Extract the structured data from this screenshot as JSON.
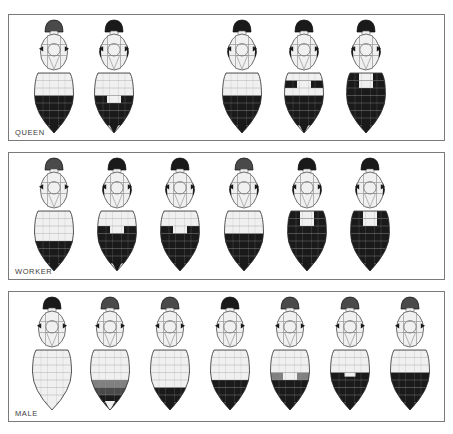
{
  "plate": {
    "title": "Bumblebee caste colour-pattern diagrams",
    "background_color": "#ffffff",
    "frame_color": "#7a7a7a",
    "ink_color": "#1a1a1a",
    "pale_color": "#f0f0f0",
    "mid_grey": "#808080",
    "dark_grey": "#4a4a4a"
  },
  "rows": [
    {
      "id": "queen",
      "label": "QUEEN",
      "count": 5,
      "bees": [
        {
          "name": "queen-1",
          "x": 22,
          "head": "dark-grey",
          "thorax_sides": "pale",
          "bands": [
            "pale",
            "pale",
            "pale",
            "black",
            "black",
            "black",
            "black",
            "black"
          ],
          "tip": "black"
        },
        {
          "name": "queen-2",
          "x": 82,
          "head": "black",
          "thorax_sides": "black",
          "bands": [
            "pale",
            "pale",
            "pale",
            "black-split",
            "black",
            "black",
            "black",
            "pale"
          ],
          "tip": "black"
        },
        {
          "name": "queen-3",
          "x": 210,
          "head": "black",
          "thorax_sides": "black",
          "bands": [
            "pale",
            "pale",
            "pale",
            "black",
            "black",
            "black",
            "black",
            "black"
          ],
          "tip": "black"
        },
        {
          "name": "queen-4",
          "x": 272,
          "head": "black",
          "thorax_sides": "black",
          "bands": [
            "pale",
            "black-split",
            "pale",
            "black",
            "black",
            "black",
            "black",
            "pale"
          ],
          "tip": "black"
        },
        {
          "name": "queen-5",
          "x": 334,
          "head": "black",
          "thorax_sides": "black",
          "bands": [
            "black-split",
            "black-split",
            "black",
            "black",
            "black",
            "black",
            "black",
            "black"
          ],
          "tip": "black"
        }
      ]
    },
    {
      "id": "worker",
      "label": "WORKER",
      "count": 6,
      "bees": [
        {
          "name": "worker-1",
          "x": 22,
          "head": "dark-grey",
          "thorax_sides": "pale",
          "bands": [
            "pale",
            "pale",
            "pale",
            "pale",
            "black",
            "black",
            "black",
            "black"
          ],
          "tip": "black"
        },
        {
          "name": "worker-2",
          "x": 85,
          "head": "black",
          "thorax_sides": "black",
          "bands": [
            "pale",
            "pale",
            "black-split",
            "black",
            "black",
            "black",
            "black",
            "pale"
          ],
          "tip": "black"
        },
        {
          "name": "worker-3",
          "x": 148,
          "head": "black",
          "thorax_sides": "black",
          "bands": [
            "pale",
            "pale",
            "black-split",
            "black",
            "black",
            "black",
            "black",
            "black"
          ],
          "tip": "black"
        },
        {
          "name": "worker-4",
          "x": 212,
          "head": "dark-grey",
          "thorax_sides": "black",
          "bands": [
            "pale",
            "pale",
            "pale",
            "black",
            "black",
            "black",
            "black",
            "black"
          ],
          "tip": "black"
        },
        {
          "name": "worker-5",
          "x": 275,
          "head": "black",
          "thorax_sides": "black",
          "bands": [
            "black-split",
            "black-split",
            "black",
            "black",
            "black",
            "black",
            "black",
            "black"
          ],
          "tip": "black"
        },
        {
          "name": "worker-6",
          "x": 338,
          "head": "black",
          "thorax_sides": "black",
          "bands": [
            "black-split",
            "black-split",
            "black",
            "black",
            "black",
            "black",
            "black",
            "black"
          ],
          "tip": "black"
        }
      ]
    },
    {
      "id": "male",
      "label": "MALE",
      "count": 7,
      "bees": [
        {
          "name": "male-1",
          "x": 20,
          "head": "black-cap",
          "thorax_sides": "pale",
          "bands": [
            "pale",
            "pale",
            "pale",
            "pale",
            "pale",
            "pale",
            "pale",
            "pale"
          ],
          "tip": "pale"
        },
        {
          "name": "male-2",
          "x": 78,
          "head": "dark-grey",
          "thorax_sides": "pale",
          "bands": [
            "pale",
            "pale",
            "pale",
            "pale",
            "grey",
            "dark-grey",
            "black",
            "black"
          ],
          "tip": "pale"
        },
        {
          "name": "male-3",
          "x": 138,
          "head": "dark-grey",
          "thorax_sides": "pale",
          "bands": [
            "pale",
            "pale",
            "pale",
            "pale",
            "pale",
            "black",
            "black",
            "black"
          ],
          "tip": "black"
        },
        {
          "name": "male-4",
          "x": 198,
          "head": "black",
          "thorax_sides": "pale",
          "bands": [
            "pale",
            "pale",
            "pale",
            "pale",
            "black",
            "black",
            "black",
            "black"
          ],
          "tip": "black"
        },
        {
          "name": "male-5",
          "x": 258,
          "head": "dark-grey",
          "thorax_sides": "pale",
          "bands": [
            "pale",
            "pale",
            "pale",
            "grey-split",
            "black",
            "black",
            "black",
            "black"
          ],
          "tip": "black"
        },
        {
          "name": "male-6",
          "x": 318,
          "head": "dark-grey",
          "thorax_sides": "pale",
          "bands": [
            "pale",
            "pale",
            "pale",
            "black-notch",
            "black",
            "black",
            "black",
            "black"
          ],
          "tip": "black"
        },
        {
          "name": "male-7",
          "x": 378,
          "head": "dark-grey",
          "thorax_sides": "pale",
          "bands": [
            "pale",
            "pale",
            "pale",
            "black",
            "black",
            "black",
            "black",
            "black"
          ],
          "tip": "black"
        }
      ]
    }
  ]
}
